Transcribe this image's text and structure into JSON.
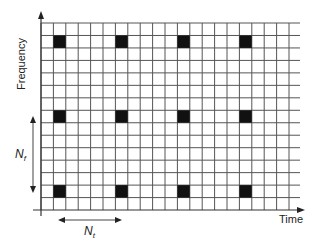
{
  "diagram": {
    "axes": {
      "x_label": "Time",
      "y_label": "Frequency"
    },
    "grid": {
      "columns": 21,
      "rows": 15,
      "origin_x": 41,
      "origin_y": 210,
      "top_y": 23,
      "right_x": 300,
      "cell_width": 12.4,
      "cell_height": 12.47,
      "line_color": "#555555",
      "pilot_color": "#111111"
    },
    "pilots": {
      "columns": [
        1,
        6,
        11,
        16
      ],
      "rows_from_top": [
        1,
        7,
        13
      ]
    },
    "annotations": {
      "frequency_spacing": {
        "symbol": "N",
        "subscript": "f"
      },
      "time_spacing": {
        "symbol": "N",
        "subscript": "t"
      }
    }
  },
  "chart_data": {
    "type": "table",
    "xlabel": "Time",
    "ylabel": "Frequency",
    "grid_cols": 21,
    "grid_rows": 15,
    "pilot_time_indices": [
      1,
      6,
      11,
      16
    ],
    "pilot_freq_indices_from_top": [
      1,
      7,
      13
    ],
    "pilot_spacing_time": "N_t (5 cells)",
    "pilot_spacing_freq": "N_f (6 cells)",
    "grid": true,
    "legend": "none"
  }
}
